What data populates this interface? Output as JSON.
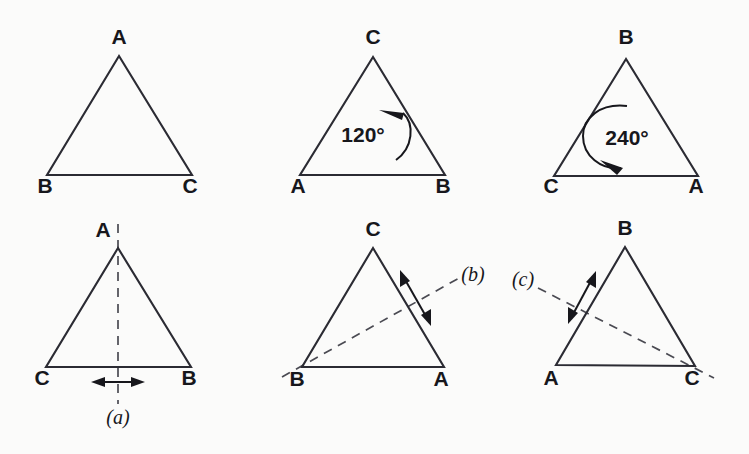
{
  "figure": {
    "background_color": "#fbfbfa",
    "stroke_color": "#2b2b33",
    "dash_color": "#4a4a52",
    "panels": [
      {
        "id": "identity",
        "position": "top-left",
        "vertices": [
          {
            "name": "apex-label",
            "text": "A",
            "x": 119,
            "y": 44
          },
          {
            "name": "bottom-left-label",
            "text": "B",
            "x": 45,
            "y": 193
          },
          {
            "name": "bottom-right-label",
            "text": "C",
            "x": 190,
            "y": 193
          }
        ],
        "annotation": null
      },
      {
        "id": "rotation-120",
        "position": "top-middle",
        "vertices": [
          {
            "name": "apex-label",
            "text": "C",
            "x": 373,
            "y": 44
          },
          {
            "name": "bottom-left-label",
            "text": "A",
            "x": 298,
            "y": 193
          },
          {
            "name": "bottom-right-label",
            "text": "B",
            "x": 443,
            "y": 193
          }
        ],
        "annotation": {
          "type": "rotation-arrow",
          "text": "120°",
          "direction": "counterclockwise"
        }
      },
      {
        "id": "rotation-240",
        "position": "top-right",
        "vertices": [
          {
            "name": "apex-label",
            "text": "B",
            "x": 626,
            "y": 44
          },
          {
            "name": "bottom-left-label",
            "text": "C",
            "x": 551,
            "y": 193
          },
          {
            "name": "bottom-right-label",
            "text": "A",
            "x": 696,
            "y": 193
          }
        ],
        "annotation": {
          "type": "rotation-arrow",
          "text": "240°",
          "direction": "clockwise"
        }
      },
      {
        "id": "reflection-a",
        "position": "bottom-left",
        "vertices": [
          {
            "name": "apex-label",
            "text": "A",
            "x": 103,
            "y": 237
          },
          {
            "name": "bottom-left-label",
            "text": "C",
            "x": 42,
            "y": 385
          },
          {
            "name": "bottom-right-label",
            "text": "B",
            "x": 189,
            "y": 385
          }
        ],
        "annotation": {
          "type": "mirror-line",
          "text": "(a)",
          "text_x": 118,
          "text_y": 424
        }
      },
      {
        "id": "reflection-b",
        "position": "bottom-middle",
        "vertices": [
          {
            "name": "apex-label",
            "text": "C",
            "x": 373,
            "y": 236
          },
          {
            "name": "bottom-left-label",
            "text": "B",
            "x": 297,
            "y": 386
          },
          {
            "name": "bottom-right-label",
            "text": "A",
            "x": 441,
            "y": 386
          }
        ],
        "annotation": {
          "type": "mirror-line",
          "text": "(b)",
          "text_x": 473,
          "text_y": 281
        }
      },
      {
        "id": "reflection-c",
        "position": "bottom-right",
        "vertices": [
          {
            "name": "apex-label",
            "text": "B",
            "x": 625,
            "y": 235
          },
          {
            "name": "bottom-left-label",
            "text": "A",
            "x": 551,
            "y": 385
          },
          {
            "name": "bottom-right-label",
            "text": "C",
            "x": 692,
            "y": 385
          }
        ],
        "annotation": {
          "type": "mirror-line",
          "text": "(c)",
          "text_x": 523,
          "text_y": 286
        }
      }
    ]
  }
}
